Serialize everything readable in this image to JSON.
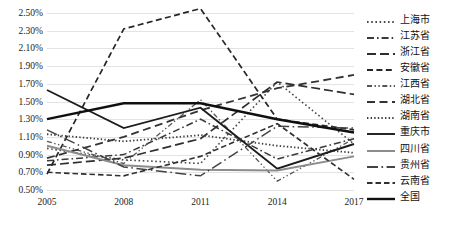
{
  "chart_data": {
    "type": "line",
    "title": "",
    "xlabel": "",
    "ylabel": "",
    "x": [
      2005,
      2008,
      2011,
      2014,
      2017
    ],
    "xtick_labels": [
      "2005",
      "2008",
      "2011",
      "2014",
      "2017"
    ],
    "ylim": [
      0.5,
      2.5
    ],
    "ytick_labels": [
      "2.50%",
      "2.30%",
      "2.10%",
      "1.90%",
      "1.70%",
      "1.50%",
      "1.30%",
      "1.10%",
      "0.90%",
      "0.70%",
      "0.50%"
    ],
    "ytick_values": [
      2.5,
      2.3,
      2.1,
      1.9,
      1.7,
      1.5,
      1.3,
      1.1,
      0.9,
      0.7,
      0.5
    ],
    "grid": true,
    "legend_position": "right",
    "series": [
      {
        "name": "上海市",
        "dash": "dotted",
        "color": "#4a4a4a",
        "width": 1.6,
        "values": [
          0.97,
          0.84,
          0.8,
          1.72,
          1.02
        ]
      },
      {
        "name": "江苏省",
        "dash": "dash-dot",
        "color": "#3a3a3a",
        "width": 1.5,
        "values": [
          0.83,
          0.9,
          1.3,
          0.85,
          1.08
        ]
      },
      {
        "name": "浙江省",
        "dash": "long-dash",
        "color": "#2e2e2e",
        "width": 1.7,
        "values": [
          0.78,
          0.86,
          1.08,
          1.72,
          1.58
        ]
      },
      {
        "name": "安徽省",
        "dash": "medium-dash",
        "color": "#262626",
        "width": 1.7,
        "values": [
          0.68,
          2.32,
          2.55,
          1.3,
          1.18
        ]
      },
      {
        "name": "江西省",
        "dash": "dash-dot-dot",
        "color": "#555555",
        "width": 1.3,
        "values": [
          1.05,
          0.8,
          1.52,
          0.6,
          1.08
        ]
      },
      {
        "name": "湖北省",
        "dash": "dash-gap",
        "color": "#333333",
        "width": 1.8,
        "values": [
          0.86,
          1.1,
          1.4,
          1.65,
          1.8
        ]
      },
      {
        "name": "湖南省",
        "dash": "fine-dotted",
        "color": "#3d3d3d",
        "width": 1.8,
        "values": [
          1.13,
          1.05,
          1.12,
          1.0,
          0.92
        ]
      },
      {
        "name": "重庆市",
        "dash": "solid",
        "color": "#1c1c1c",
        "width": 1.9,
        "values": [
          1.63,
          1.2,
          1.43,
          0.74,
          1.02
        ]
      },
      {
        "name": "四川省",
        "dash": "solid",
        "color": "#8c8c8c",
        "width": 2.0,
        "values": [
          1.0,
          0.78,
          0.73,
          0.72,
          0.88
        ]
      },
      {
        "name": "贵州省",
        "dash": "long-dash-dot",
        "color": "#444444",
        "width": 1.5,
        "values": [
          1.18,
          0.76,
          0.66,
          1.22,
          1.2
        ]
      },
      {
        "name": "云南省",
        "dash": "dash-short",
        "color": "#303030",
        "width": 1.6,
        "values": [
          0.7,
          0.66,
          0.88,
          1.25,
          0.62
        ]
      },
      {
        "name": "全国",
        "dash": "solid",
        "color": "#101010",
        "width": 2.4,
        "values": [
          1.3,
          1.48,
          1.48,
          1.3,
          1.15
        ]
      }
    ]
  },
  "legend": {
    "items": [
      {
        "label": "上海市"
      },
      {
        "label": "江苏省"
      },
      {
        "label": "浙江省"
      },
      {
        "label": "安徽省"
      },
      {
        "label": "江西省"
      },
      {
        "label": "湖北省"
      },
      {
        "label": "湖南省"
      },
      {
        "label": "重庆市"
      },
      {
        "label": "四川省"
      },
      {
        "label": "贵州省"
      },
      {
        "label": "云南省"
      },
      {
        "label": "全国"
      }
    ]
  },
  "colors": {
    "gridline": "#e3e3e3",
    "background": "#ffffff",
    "text": "#1c1c1c",
    "gray_series": "#8c8c8c"
  }
}
